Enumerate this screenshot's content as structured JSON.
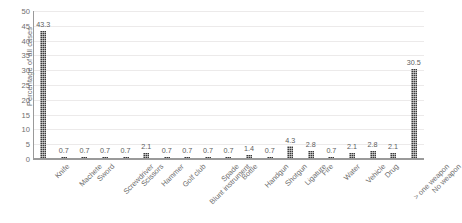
{
  "chart_data": {
    "type": "bar",
    "title": "",
    "subtitle": "",
    "xlabel": "",
    "ylabel": "Percentage of all cases",
    "ylim": [
      0,
      50
    ],
    "ytick_step": 5,
    "yticks": [
      0,
      5,
      10,
      15,
      20,
      25,
      30,
      35,
      40,
      45,
      50
    ],
    "grid": true,
    "grid_axis": "y",
    "legend": false,
    "legend_position": "none",
    "data_labels": true,
    "bar_color": "#3a3a3a",
    "bar_pattern": "dotted",
    "axis_color": "#9a9a9a",
    "text_color": "#6e6e6e",
    "categories": [
      "Knife",
      "Machete",
      "Sword",
      "Screwdriver",
      "Scissors",
      "Hammer",
      "Golf club",
      "Blunt instrument",
      "Spade",
      "Bottle",
      "Handgun",
      "Shotgun",
      "Ligature",
      "Fire",
      "Water",
      "Vehicle",
      "Drug",
      "> one weapon",
      "No weapon"
    ],
    "values": [
      43.3,
      0.7,
      0.7,
      0.7,
      0.7,
      2.1,
      0.7,
      0.7,
      0.7,
      0.7,
      1.4,
      0.7,
      4.3,
      2.8,
      0.7,
      2.1,
      2.8,
      2.1,
      30.5
    ],
    "value_labels": [
      "43.3",
      "0.7",
      "0.7",
      "0.7",
      "0.7",
      "2.1",
      "0.7",
      "0.7",
      "0.7",
      "0.7",
      "1.4",
      "0.7",
      "4.3",
      "2.8",
      "0.7",
      "2.1",
      "2.8",
      "2.1",
      "30.5"
    ]
  }
}
